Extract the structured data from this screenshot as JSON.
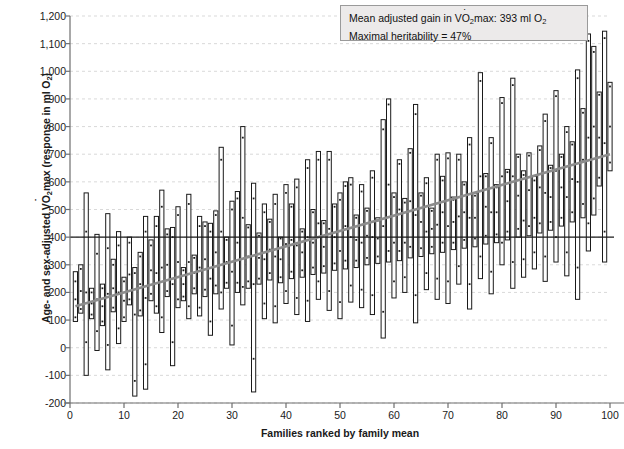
{
  "chart_data": {
    "type": "bar",
    "title": "",
    "xlabel": "Families ranked by family mean",
    "ylabel": "Age- and sex-adjusted VO2max (response in ml O2)",
    "ylabel_parts": {
      "pre": "Age- and sex-adjusted V",
      "o": "O",
      "sub1": "2",
      "mid": "max (response in ml O",
      "sub2": "2",
      "post": ")"
    },
    "xlim": [
      0,
      100
    ],
    "ylim": [
      -200,
      1200
    ],
    "ytick_values": [
      1200,
      1100,
      1000,
      900,
      800,
      700,
      600,
      500,
      400,
      300,
      200,
      100,
      0,
      -100,
      -200
    ],
    "ytick_labels": [
      "1,200",
      "1,100",
      "1,000",
      "900",
      "800",
      "700",
      "600",
      "500",
      "400",
      "300",
      "200",
      "100",
      "0",
      "-100",
      "-200"
    ],
    "xtick_values": [
      0,
      10,
      20,
      30,
      40,
      50,
      60,
      70,
      80,
      90,
      100
    ],
    "xtick_labels": [
      "0",
      "10",
      "20",
      "30",
      "40",
      "50",
      "60",
      "70",
      "80",
      "90",
      "100"
    ],
    "grid": true,
    "grid_style": "dashed",
    "grid_color": "#cfcfcf",
    "bar_fill": "#ffffff",
    "bar_edge": "#1a1a1a",
    "point_color": "#1a1a1a",
    "reference_line": {
      "value": 400,
      "color": "#1a1a1a",
      "label": ""
    },
    "trend_line": {
      "color": "#8c8c8c",
      "start": [
        1,
        150
      ],
      "end": [
        100,
        700
      ]
    },
    "series_note": "Each vertical bar spans the min-max range of individual responses within one family; dots are individual members.",
    "categories": [
      1,
      2,
      3,
      4,
      5,
      6,
      7,
      8,
      9,
      10,
      11,
      12,
      13,
      14,
      15,
      16,
      17,
      18,
      19,
      20,
      21,
      22,
      23,
      24,
      25,
      26,
      27,
      28,
      29,
      30,
      31,
      32,
      33,
      34,
      35,
      36,
      37,
      38,
      39,
      40,
      41,
      42,
      43,
      44,
      45,
      46,
      47,
      48,
      49,
      50,
      51,
      52,
      53,
      54,
      55,
      56,
      57,
      58,
      59,
      60,
      61,
      62,
      63,
      64,
      65,
      66,
      67,
      68,
      69,
      70,
      71,
      72,
      73,
      74,
      75,
      76,
      77,
      78,
      79,
      80,
      81,
      82,
      83,
      84,
      85,
      86,
      87,
      88,
      89,
      90,
      91,
      92,
      93,
      94,
      95,
      96,
      97,
      98,
      99,
      100
    ],
    "bars": [
      {
        "x": 1,
        "low": 95,
        "high": 275,
        "points": [
          110,
          175,
          240
        ]
      },
      {
        "x": 2,
        "low": 125,
        "high": 300,
        "points": [
          140,
          205,
          285
        ]
      },
      {
        "x": 3,
        "low": -100,
        "high": 560,
        "points": [
          20,
          200,
          420
        ]
      },
      {
        "x": 4,
        "low": 105,
        "high": 215,
        "points": [
          120,
          160,
          200
        ]
      },
      {
        "x": 5,
        "low": -10,
        "high": 410,
        "points": [
          60,
          175,
          340
        ]
      },
      {
        "x": 6,
        "low": 80,
        "high": 230,
        "points": [
          95,
          150,
          215
        ]
      },
      {
        "x": 7,
        "low": -80,
        "high": 485,
        "points": [
          10,
          195,
          360
        ]
      },
      {
        "x": 8,
        "low": 130,
        "high": 320,
        "points": [
          145,
          215,
          300
        ]
      },
      {
        "x": 9,
        "low": 15,
        "high": 420,
        "points": [
          70,
          200,
          370
        ]
      },
      {
        "x": 10,
        "low": 95,
        "high": 255,
        "points": [
          110,
          170,
          240
        ]
      },
      {
        "x": 11,
        "low": 155,
        "high": 400,
        "points": [
          175,
          265,
          380
        ]
      },
      {
        "x": 12,
        "low": -175,
        "high": 290,
        "points": [
          -120,
          120,
          270
        ]
      },
      {
        "x": 13,
        "low": 115,
        "high": 345,
        "points": [
          135,
          230,
          330
        ]
      },
      {
        "x": 14,
        "low": -150,
        "high": 475,
        "points": [
          -60,
          180,
          420
        ]
      },
      {
        "x": 15,
        "low": 170,
        "high": 390,
        "points": [
          195,
          280,
          370
        ]
      },
      {
        "x": 16,
        "low": 125,
        "high": 475,
        "points": [
          150,
          270,
          440
        ]
      },
      {
        "x": 17,
        "low": 55,
        "high": 570,
        "points": [
          110,
          290,
          510
        ]
      },
      {
        "x": 18,
        "low": 185,
        "high": 430,
        "points": [
          205,
          300,
          410
        ]
      },
      {
        "x": 19,
        "low": -65,
        "high": 435,
        "points": [
          20,
          230,
          400
        ]
      },
      {
        "x": 20,
        "low": 145,
        "high": 510,
        "points": [
          175,
          310,
          480
        ]
      },
      {
        "x": 21,
        "low": 170,
        "high": 290,
        "points": [
          185,
          230,
          280
        ]
      },
      {
        "x": 22,
        "low": 105,
        "high": 555,
        "points": [
          150,
          310,
          520
        ]
      },
      {
        "x": 23,
        "low": 195,
        "high": 335,
        "points": [
          215,
          270,
          325
        ]
      },
      {
        "x": 24,
        "low": 115,
        "high": 475,
        "points": [
          145,
          290,
          440
        ]
      },
      {
        "x": 25,
        "low": 185,
        "high": 455,
        "points": [
          210,
          320,
          440
        ]
      },
      {
        "x": 26,
        "low": 45,
        "high": 450,
        "points": [
          95,
          250,
          420
        ]
      },
      {
        "x": 27,
        "low": 195,
        "high": 495,
        "points": [
          225,
          345,
          480
        ]
      },
      {
        "x": 28,
        "low": 140,
        "high": 725,
        "points": [
          200,
          420,
          680
        ]
      },
      {
        "x": 29,
        "low": 215,
        "high": 400,
        "points": [
          235,
          310,
          390
        ]
      },
      {
        "x": 30,
        "low": 10,
        "high": 530,
        "points": [
          80,
          275,
          500
        ]
      },
      {
        "x": 31,
        "low": 200,
        "high": 565,
        "points": [
          235,
          380,
          540
        ]
      },
      {
        "x": 32,
        "low": 155,
        "high": 800,
        "points": [
          220,
          470,
          760
        ]
      },
      {
        "x": 33,
        "low": 215,
        "high": 445,
        "points": [
          240,
          330,
          435
        ]
      },
      {
        "x": 34,
        "low": -160,
        "high": 595,
        "points": [
          -40,
          230,
          540
        ]
      },
      {
        "x": 35,
        "low": 230,
        "high": 415,
        "points": [
          250,
          325,
          405
        ]
      },
      {
        "x": 36,
        "low": 105,
        "high": 520,
        "points": [
          160,
          320,
          490
        ]
      },
      {
        "x": 37,
        "low": 245,
        "high": 465,
        "points": [
          270,
          355,
          455
        ]
      },
      {
        "x": 38,
        "low": 90,
        "high": 555,
        "points": [
          150,
          330,
          520
        ]
      },
      {
        "x": 39,
        "low": 235,
        "high": 400,
        "points": [
          255,
          320,
          395
        ]
      },
      {
        "x": 40,
        "low": 160,
        "high": 590,
        "points": [
          205,
          375,
          560
        ]
      },
      {
        "x": 41,
        "low": 250,
        "high": 520,
        "points": [
          275,
          390,
          510
        ]
      },
      {
        "x": 42,
        "low": 120,
        "high": 610,
        "points": [
          180,
          370,
          580
        ]
      },
      {
        "x": 43,
        "low": 255,
        "high": 430,
        "points": [
          280,
          345,
          420
        ]
      },
      {
        "x": 44,
        "low": 95,
        "high": 680,
        "points": [
          170,
          400,
          650
        ]
      },
      {
        "x": 45,
        "low": 265,
        "high": 500,
        "points": [
          290,
          380,
          490
        ]
      },
      {
        "x": 46,
        "low": 175,
        "high": 710,
        "points": [
          240,
          450,
          680
        ]
      },
      {
        "x": 47,
        "low": 270,
        "high": 460,
        "points": [
          295,
          365,
          450
        ]
      },
      {
        "x": 48,
        "low": 135,
        "high": 710,
        "points": [
          205,
          430,
          680
        ]
      },
      {
        "x": 49,
        "low": 280,
        "high": 520,
        "points": [
          305,
          400,
          510
        ]
      },
      {
        "x": 50,
        "low": 105,
        "high": 560,
        "points": [
          165,
          350,
          535
        ]
      },
      {
        "x": 51,
        "low": 285,
        "high": 600,
        "points": [
          315,
          440,
          585
        ]
      },
      {
        "x": 52,
        "low": 165,
        "high": 615,
        "points": [
          225,
          400,
          590
        ]
      },
      {
        "x": 53,
        "low": 290,
        "high": 480,
        "points": [
          315,
          390,
          470
        ]
      },
      {
        "x": 54,
        "low": 145,
        "high": 590,
        "points": [
          210,
          380,
          565
        ]
      },
      {
        "x": 55,
        "low": 300,
        "high": 505,
        "points": [
          325,
          405,
          495
        ]
      },
      {
        "x": 56,
        "low": 120,
        "high": 640,
        "points": [
          190,
          400,
          615
        ]
      },
      {
        "x": 57,
        "low": 305,
        "high": 470,
        "points": [
          330,
          395,
          460
        ]
      },
      {
        "x": 58,
        "low": 35,
        "high": 825,
        "points": [
          130,
          440,
          790
        ]
      },
      {
        "x": 59,
        "low": 310,
        "high": 900,
        "points": [
          350,
          590,
          880
        ]
      },
      {
        "x": 60,
        "low": 180,
        "high": 560,
        "points": [
          240,
          380,
          545
        ]
      },
      {
        "x": 61,
        "low": 315,
        "high": 680,
        "points": [
          350,
          500,
          665
        ]
      },
      {
        "x": 62,
        "low": 200,
        "high": 540,
        "points": [
          255,
          380,
          525
        ]
      },
      {
        "x": 63,
        "low": 325,
        "high": 720,
        "points": [
          365,
          530,
          705
        ]
      },
      {
        "x": 64,
        "low": 90,
        "high": 880,
        "points": [
          190,
          480,
          845
        ]
      },
      {
        "x": 65,
        "low": 330,
        "high": 560,
        "points": [
          360,
          455,
          550
        ]
      },
      {
        "x": 66,
        "low": 210,
        "high": 615,
        "points": [
          270,
          420,
          595
        ]
      },
      {
        "x": 67,
        "low": 340,
        "high": 505,
        "points": [
          365,
          430,
          495
        ]
      },
      {
        "x": 68,
        "low": 175,
        "high": 700,
        "points": [
          250,
          445,
          680
        ]
      },
      {
        "x": 69,
        "low": 345,
        "high": 620,
        "points": [
          380,
          490,
          605
        ]
      },
      {
        "x": 70,
        "low": 160,
        "high": 705,
        "points": [
          240,
          440,
          685
        ]
      },
      {
        "x": 71,
        "low": 355,
        "high": 545,
        "points": [
          380,
          455,
          535
        ]
      },
      {
        "x": 72,
        "low": 230,
        "high": 700,
        "points": [
          295,
          475,
          680
        ]
      },
      {
        "x": 73,
        "low": 360,
        "high": 600,
        "points": [
          390,
          490,
          590
        ]
      },
      {
        "x": 74,
        "low": 140,
        "high": 760,
        "points": [
          230,
          470,
          735
        ]
      },
      {
        "x": 75,
        "low": 365,
        "high": 560,
        "points": [
          395,
          470,
          550
        ]
      },
      {
        "x": 76,
        "low": 250,
        "high": 995,
        "points": [
          330,
          620,
          965
        ]
      },
      {
        "x": 77,
        "low": 375,
        "high": 630,
        "points": [
          405,
          510,
          620
        ]
      },
      {
        "x": 78,
        "low": 195,
        "high": 760,
        "points": [
          275,
          490,
          740
        ]
      },
      {
        "x": 79,
        "low": 380,
        "high": 590,
        "points": [
          410,
          490,
          580
        ]
      },
      {
        "x": 80,
        "low": 300,
        "high": 905,
        "points": [
          380,
          620,
          885
        ]
      },
      {
        "x": 81,
        "low": 390,
        "high": 645,
        "points": [
          420,
          530,
          635
        ]
      },
      {
        "x": 82,
        "low": 215,
        "high": 975,
        "points": [
          310,
          620,
          950
        ]
      },
      {
        "x": 83,
        "low": 400,
        "high": 700,
        "points": [
          430,
          550,
          690
        ]
      },
      {
        "x": 84,
        "low": 255,
        "high": 640,
        "points": [
          320,
          460,
          625
        ]
      },
      {
        "x": 85,
        "low": 405,
        "high": 705,
        "points": [
          440,
          570,
          695
        ]
      },
      {
        "x": 86,
        "low": 285,
        "high": 620,
        "points": [
          345,
          470,
          605
        ]
      },
      {
        "x": 87,
        "low": 415,
        "high": 730,
        "points": [
          450,
          580,
          715
        ]
      },
      {
        "x": 88,
        "low": 240,
        "high": 845,
        "points": [
          330,
          560,
          820
        ]
      },
      {
        "x": 89,
        "low": 425,
        "high": 660,
        "points": [
          455,
          545,
          650
        ]
      },
      {
        "x": 90,
        "low": 310,
        "high": 930,
        "points": [
          400,
          640,
          910
        ]
      },
      {
        "x": 91,
        "low": 440,
        "high": 700,
        "points": [
          470,
          580,
          690
        ]
      },
      {
        "x": 92,
        "low": 260,
        "high": 800,
        "points": [
          345,
          545,
          780
        ]
      },
      {
        "x": 93,
        "low": 455,
        "high": 745,
        "points": [
          490,
          610,
          735
        ]
      },
      {
        "x": 94,
        "low": 175,
        "high": 1005,
        "points": [
          290,
          600,
          975
        ]
      },
      {
        "x": 95,
        "low": 470,
        "high": 865,
        "points": [
          520,
          680,
          850
        ]
      },
      {
        "x": 96,
        "low": 350,
        "high": 1135,
        "points": [
          450,
          760,
          1110
        ]
      },
      {
        "x": 97,
        "low": 480,
        "high": 1090,
        "points": [
          540,
          800,
          1070
        ]
      },
      {
        "x": 98,
        "low": 585,
        "high": 925,
        "points": [
          615,
          760,
          915
        ]
      },
      {
        "x": 99,
        "low": 310,
        "high": 1145,
        "points": [
          420,
          740,
          1120
        ]
      },
      {
        "x": 100,
        "low": 640,
        "high": 960,
        "points": [
          670,
          800,
          945
        ]
      }
    ],
    "annotations": [
      "Mean adjusted gain in VO2max: 393 ml O2",
      "Maximal heritability = 47%"
    ]
  },
  "legend": {
    "line1_pre": "Mean adjusted gain in V",
    "line1_o": "O",
    "line1_sub": "2",
    "line1_mid": "max: 393 ml O",
    "line1_sub2": "2",
    "line2": "Maximal heritability = 47%"
  }
}
